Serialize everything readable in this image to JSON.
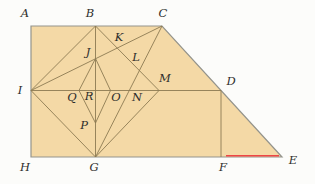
{
  "figure": {
    "canvas": {
      "width": 315,
      "height": 184
    },
    "colors": {
      "page_background": "#fcfcfa",
      "shape_fill": "#f4d9a6",
      "outline_stroke": "#94948c",
      "inner_stroke": "#8c7a52",
      "label_color": "#2e2e2c",
      "highlight_red": "#ee4545"
    },
    "outline": [
      [
        31,
        26
      ],
      [
        162,
        26
      ],
      [
        282,
        157
      ],
      [
        31,
        157
      ]
    ],
    "points": {
      "A": [
        31,
        26
      ],
      "B": [
        95.5,
        26
      ],
      "C": [
        162,
        26
      ],
      "D": [
        221,
        90.5
      ],
      "E": [
        282,
        157
      ],
      "F": [
        221,
        157
      ],
      "G": [
        95.5,
        157
      ],
      "H": [
        31,
        157
      ],
      "I": [
        31,
        90.5
      ],
      "J": [
        95.5,
        58.5
      ],
      "K": [
        117.5,
        48
      ],
      "L": [
        139.5,
        70
      ],
      "M": [
        159,
        90.5
      ],
      "N": [
        128,
        90.5
      ],
      "O": [
        110.5,
        90.5
      ],
      "P": [
        95.5,
        123
      ],
      "Q": [
        79,
        90.5
      ],
      "R": [
        95.5,
        90.5
      ]
    },
    "segments": [
      [
        "I",
        "D"
      ],
      [
        "B",
        "G"
      ],
      [
        "D",
        "F"
      ],
      [
        "I",
        "B"
      ],
      [
        "I",
        "C"
      ],
      [
        "I",
        "G"
      ],
      [
        "C",
        "G"
      ],
      [
        "B",
        "M"
      ],
      [
        "G",
        "M"
      ],
      [
        "J",
        "Q"
      ],
      [
        "Q",
        "P"
      ],
      [
        "P",
        "O"
      ],
      [
        "O",
        "J"
      ]
    ],
    "highlight_segment": {
      "x1": 226,
      "y1": 155.7,
      "x2": 279,
      "y2": 155.7
    },
    "labels": [
      {
        "text": "A",
        "x": 25,
        "y": 17
      },
      {
        "text": "B",
        "x": 90,
        "y": 17
      },
      {
        "text": "C",
        "x": 163,
        "y": 17
      },
      {
        "text": "D",
        "x": 231,
        "y": 85
      },
      {
        "text": "E",
        "x": 293,
        "y": 164
      },
      {
        "text": "F",
        "x": 223,
        "y": 171
      },
      {
        "text": "G",
        "x": 94,
        "y": 171
      },
      {
        "text": "H",
        "x": 25,
        "y": 171
      },
      {
        "text": "I",
        "x": 20,
        "y": 94
      },
      {
        "text": "J",
        "x": 88,
        "y": 56
      },
      {
        "text": "K",
        "x": 119,
        "y": 41
      },
      {
        "text": "L",
        "x": 136,
        "y": 61
      },
      {
        "text": "M",
        "x": 165,
        "y": 82
      },
      {
        "text": "N",
        "x": 137,
        "y": 101
      },
      {
        "text": "O",
        "x": 116,
        "y": 101
      },
      {
        "text": "P",
        "x": 84,
        "y": 129
      },
      {
        "text": "Q",
        "x": 72,
        "y": 101
      },
      {
        "text": "R",
        "x": 89,
        "y": 100
      }
    ]
  }
}
